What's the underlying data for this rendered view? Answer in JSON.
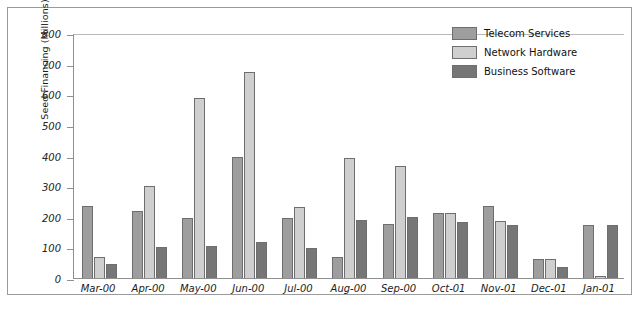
{
  "chart_data": {
    "type": "bar",
    "title": "",
    "xlabel": "",
    "ylabel": "Seed Financing (Millions)",
    "ylim": [
      0,
      800
    ],
    "ytick_step": 100,
    "yticks": [
      0,
      100,
      200,
      300,
      400,
      500,
      600,
      700,
      800
    ],
    "grid": false,
    "legend_position": "top-right",
    "categories": [
      "Mar-00",
      "Apr-00",
      "May-00",
      "Jun-00",
      "Jul-00",
      "Aug-00",
      "Sep-00",
      "Oct-01",
      "Nov-01",
      "Dec-01",
      "Jan-01"
    ],
    "series": [
      {
        "name": "Telecom Services",
        "color": "#9e9e9e",
        "values": [
          235,
          220,
          197,
          395,
          197,
          67,
          177,
          212,
          234,
          62,
          172
        ]
      },
      {
        "name": "Network Hardware",
        "color": "#cfcfcf",
        "values": [
          68,
          300,
          588,
          672,
          232,
          393,
          367,
          212,
          186,
          62,
          8
        ]
      },
      {
        "name": "Business Software",
        "color": "#767676",
        "values": [
          47,
          101,
          105,
          117,
          99,
          191,
          199,
          182,
          174,
          37,
          173
        ]
      }
    ]
  }
}
